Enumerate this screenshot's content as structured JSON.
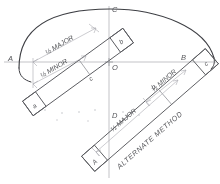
{
  "figure": {
    "kind": "technical-drawing",
    "medium": "pencil line drawing on white paper",
    "background_color": "#ffffff",
    "line_color": "#5a5b60",
    "construction_line_color": "#a9aab0",
    "arc_color": "#3e3f44"
  },
  "points": {
    "a": "A",
    "b": "B",
    "c": "C",
    "d": "D",
    "o": "O"
  },
  "strip_upper": {
    "label_major": "½ MAJOR",
    "label_minor": "½ MINOR",
    "end_near": "a",
    "end_far": "b",
    "mark_mid": "c"
  },
  "strip_lower": {
    "title": "ALTERNATE METHOD",
    "label_major": "½ MAJOR",
    "label_minor": "½ MINOR",
    "end_near": "A",
    "end_far": "c",
    "mark_mid": "b"
  },
  "axes": {
    "major_axis": "A — O — B",
    "minor_axis": "C — O — D"
  }
}
